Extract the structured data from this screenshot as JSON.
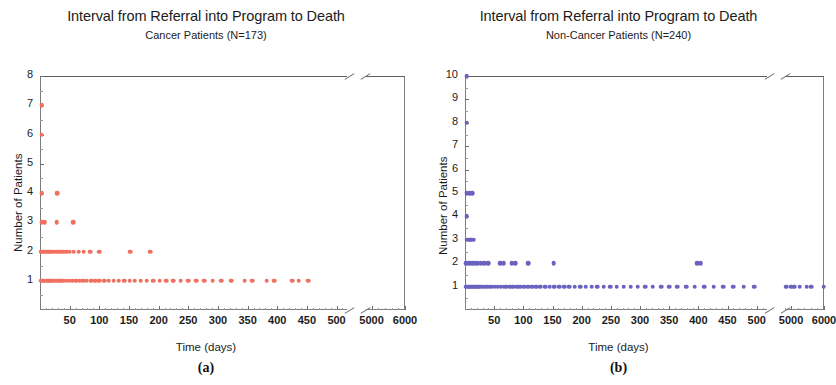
{
  "figure": {
    "caption_a": "(a)",
    "caption_b": "(b)"
  },
  "panels": [
    {
      "key": "a",
      "title": "Interval from Referral into Program to Death",
      "subtitle": "Cancer Patients (N=173)",
      "caption": "(a)",
      "xlabel": "Time (days)",
      "ylabel": "Number of Patients",
      "color": "#F0705F"
    },
    {
      "key": "b",
      "title": "Interval from Referral into Program to Death",
      "subtitle": "Non-Cancer Patients (N=240)",
      "caption": "(b)",
      "xlabel": "Time (days)",
      "ylabel": "Number of Patients",
      "color": "#6A62BE"
    }
  ],
  "chart_data": [
    {
      "type": "scatter",
      "panel": "a",
      "title": "Interval from Referral into Program to Death",
      "subtitle": "Cancer Patients (N=173)",
      "caption": "(a)",
      "xlabel": "Time (days)",
      "ylabel": "Number of Patients",
      "marker_color": "#F0705F",
      "grid": false,
      "legend": "none",
      "axis_break": {
        "from": 520,
        "to": 4800
      },
      "xlim": [
        0,
        6000
      ],
      "ylim": [
        0,
        8
      ],
      "xticks": [
        50,
        100,
        150,
        200,
        250,
        300,
        350,
        400,
        450,
        500,
        5000,
        6000
      ],
      "xticklabels": [
        "50",
        "100",
        "150",
        "200",
        "250",
        "300",
        "350",
        "400",
        "450",
        "500",
        "5000",
        "6000"
      ],
      "yticks": [
        1,
        2,
        3,
        4,
        5,
        6,
        7,
        8
      ],
      "yticklabels": [
        "1",
        "2",
        "3",
        "4",
        "5",
        "6",
        "7",
        "8"
      ],
      "points": [
        {
          "x": 3,
          "y": 7
        },
        {
          "x": 3,
          "y": 6
        },
        {
          "x": 3,
          "y": 4
        },
        {
          "x": 29,
          "y": 4
        },
        {
          "x": 3,
          "y": 3
        },
        {
          "x": 8,
          "y": 3
        },
        {
          "x": 28,
          "y": 3
        },
        {
          "x": 56,
          "y": 3
        },
        {
          "x": 2,
          "y": 2
        },
        {
          "x": 5,
          "y": 2
        },
        {
          "x": 8,
          "y": 2
        },
        {
          "x": 11,
          "y": 2
        },
        {
          "x": 14,
          "y": 2
        },
        {
          "x": 17,
          "y": 2
        },
        {
          "x": 21,
          "y": 2
        },
        {
          "x": 25,
          "y": 2
        },
        {
          "x": 29,
          "y": 2
        },
        {
          "x": 34,
          "y": 2
        },
        {
          "x": 39,
          "y": 2
        },
        {
          "x": 44,
          "y": 2
        },
        {
          "x": 50,
          "y": 2
        },
        {
          "x": 57,
          "y": 2
        },
        {
          "x": 65,
          "y": 2
        },
        {
          "x": 74,
          "y": 2
        },
        {
          "x": 85,
          "y": 2
        },
        {
          "x": 100,
          "y": 2
        },
        {
          "x": 152,
          "y": 2
        },
        {
          "x": 186,
          "y": 2
        },
        {
          "x": 2,
          "y": 1
        },
        {
          "x": 5,
          "y": 1
        },
        {
          "x": 8,
          "y": 1
        },
        {
          "x": 11,
          "y": 1
        },
        {
          "x": 14,
          "y": 1
        },
        {
          "x": 17,
          "y": 1
        },
        {
          "x": 20,
          "y": 1
        },
        {
          "x": 24,
          "y": 1
        },
        {
          "x": 28,
          "y": 1
        },
        {
          "x": 32,
          "y": 1
        },
        {
          "x": 36,
          "y": 1
        },
        {
          "x": 40,
          "y": 1
        },
        {
          "x": 45,
          "y": 1
        },
        {
          "x": 50,
          "y": 1
        },
        {
          "x": 55,
          "y": 1
        },
        {
          "x": 61,
          "y": 1
        },
        {
          "x": 67,
          "y": 1
        },
        {
          "x": 73,
          "y": 1
        },
        {
          "x": 79,
          "y": 1
        },
        {
          "x": 86,
          "y": 1
        },
        {
          "x": 93,
          "y": 1
        },
        {
          "x": 100,
          "y": 1
        },
        {
          "x": 108,
          "y": 1
        },
        {
          "x": 116,
          "y": 1
        },
        {
          "x": 124,
          "y": 1
        },
        {
          "x": 133,
          "y": 1
        },
        {
          "x": 142,
          "y": 1
        },
        {
          "x": 151,
          "y": 1
        },
        {
          "x": 160,
          "y": 1
        },
        {
          "x": 170,
          "y": 1
        },
        {
          "x": 180,
          "y": 1
        },
        {
          "x": 191,
          "y": 1
        },
        {
          "x": 202,
          "y": 1
        },
        {
          "x": 213,
          "y": 1
        },
        {
          "x": 225,
          "y": 1
        },
        {
          "x": 237,
          "y": 1
        },
        {
          "x": 250,
          "y": 1
        },
        {
          "x": 263,
          "y": 1
        },
        {
          "x": 277,
          "y": 1
        },
        {
          "x": 291,
          "y": 1
        },
        {
          "x": 306,
          "y": 1
        },
        {
          "x": 322,
          "y": 1
        },
        {
          "x": 345,
          "y": 1
        },
        {
          "x": 358,
          "y": 1
        },
        {
          "x": 382,
          "y": 1
        },
        {
          "x": 395,
          "y": 1
        },
        {
          "x": 425,
          "y": 1
        },
        {
          "x": 436,
          "y": 1
        },
        {
          "x": 452,
          "y": 1
        }
      ]
    },
    {
      "type": "scatter",
      "panel": "b",
      "title": "Interval from Referral into Program to Death",
      "subtitle": "Non-Cancer Patients (N=240)",
      "caption": "(b)",
      "xlabel": "Time (days)",
      "ylabel": "Number of Patients",
      "marker_color": "#6A62BE",
      "grid": false,
      "legend": "none",
      "axis_break": {
        "from": 520,
        "to": 4800
      },
      "xlim": [
        0,
        6000
      ],
      "ylim": [
        0,
        10
      ],
      "xticks": [
        50,
        100,
        150,
        200,
        250,
        300,
        350,
        400,
        450,
        500,
        5000,
        6000
      ],
      "xticklabels": [
        "50",
        "100",
        "150",
        "200",
        "250",
        "300",
        "350",
        "400",
        "450",
        "500",
        "5000",
        "6000"
      ],
      "yticks": [
        1,
        2,
        3,
        4,
        5,
        6,
        7,
        8,
        9,
        10
      ],
      "yticklabels": [
        "1",
        "2",
        "3",
        "4",
        "5",
        "6",
        "7",
        "8",
        "9",
        "10"
      ],
      "points": [
        {
          "x": 3,
          "y": 10
        },
        {
          "x": 3,
          "y": 8
        },
        {
          "x": 3,
          "y": 5
        },
        {
          "x": 8,
          "y": 5
        },
        {
          "x": 12,
          "y": 5
        },
        {
          "x": 3,
          "y": 4
        },
        {
          "x": 3,
          "y": 3
        },
        {
          "x": 7,
          "y": 3
        },
        {
          "x": 11,
          "y": 3
        },
        {
          "x": 15,
          "y": 3
        },
        {
          "x": 2,
          "y": 2
        },
        {
          "x": 7,
          "y": 2
        },
        {
          "x": 12,
          "y": 2
        },
        {
          "x": 17,
          "y": 2
        },
        {
          "x": 22,
          "y": 2
        },
        {
          "x": 27,
          "y": 2
        },
        {
          "x": 33,
          "y": 2
        },
        {
          "x": 40,
          "y": 2
        },
        {
          "x": 60,
          "y": 2
        },
        {
          "x": 66,
          "y": 2
        },
        {
          "x": 80,
          "y": 2
        },
        {
          "x": 86,
          "y": 2
        },
        {
          "x": 108,
          "y": 2
        },
        {
          "x": 152,
          "y": 2
        },
        {
          "x": 398,
          "y": 2
        },
        {
          "x": 404,
          "y": 2
        },
        {
          "x": 2,
          "y": 1
        },
        {
          "x": 5,
          "y": 1
        },
        {
          "x": 8,
          "y": 1
        },
        {
          "x": 11,
          "y": 1
        },
        {
          "x": 14,
          "y": 1
        },
        {
          "x": 17,
          "y": 1
        },
        {
          "x": 20,
          "y": 1
        },
        {
          "x": 23,
          "y": 1
        },
        {
          "x": 26,
          "y": 1
        },
        {
          "x": 30,
          "y": 1
        },
        {
          "x": 34,
          "y": 1
        },
        {
          "x": 38,
          "y": 1
        },
        {
          "x": 42,
          "y": 1
        },
        {
          "x": 46,
          "y": 1
        },
        {
          "x": 51,
          "y": 1
        },
        {
          "x": 56,
          "y": 1
        },
        {
          "x": 61,
          "y": 1
        },
        {
          "x": 66,
          "y": 1
        },
        {
          "x": 71,
          "y": 1
        },
        {
          "x": 77,
          "y": 1
        },
        {
          "x": 83,
          "y": 1
        },
        {
          "x": 89,
          "y": 1
        },
        {
          "x": 95,
          "y": 1
        },
        {
          "x": 101,
          "y": 1
        },
        {
          "x": 108,
          "y": 1
        },
        {
          "x": 115,
          "y": 1
        },
        {
          "x": 122,
          "y": 1
        },
        {
          "x": 129,
          "y": 1
        },
        {
          "x": 137,
          "y": 1
        },
        {
          "x": 145,
          "y": 1
        },
        {
          "x": 153,
          "y": 1
        },
        {
          "x": 161,
          "y": 1
        },
        {
          "x": 170,
          "y": 1
        },
        {
          "x": 179,
          "y": 1
        },
        {
          "x": 188,
          "y": 1
        },
        {
          "x": 197,
          "y": 1
        },
        {
          "x": 207,
          "y": 1
        },
        {
          "x": 217,
          "y": 1
        },
        {
          "x": 227,
          "y": 1
        },
        {
          "x": 238,
          "y": 1
        },
        {
          "x": 249,
          "y": 1
        },
        {
          "x": 260,
          "y": 1
        },
        {
          "x": 272,
          "y": 1
        },
        {
          "x": 284,
          "y": 1
        },
        {
          "x": 296,
          "y": 1
        },
        {
          "x": 309,
          "y": 1
        },
        {
          "x": 322,
          "y": 1
        },
        {
          "x": 336,
          "y": 1
        },
        {
          "x": 350,
          "y": 1
        },
        {
          "x": 364,
          "y": 1
        },
        {
          "x": 379,
          "y": 1
        },
        {
          "x": 394,
          "y": 1
        },
        {
          "x": 410,
          "y": 1
        },
        {
          "x": 426,
          "y": 1
        },
        {
          "x": 443,
          "y": 1
        },
        {
          "x": 460,
          "y": 1
        },
        {
          "x": 478,
          "y": 1
        },
        {
          "x": 496,
          "y": 1
        },
        {
          "x": 4850,
          "y": 1
        },
        {
          "x": 5000,
          "y": 1
        },
        {
          "x": 5100,
          "y": 1
        },
        {
          "x": 5260,
          "y": 1
        },
        {
          "x": 5480,
          "y": 1
        },
        {
          "x": 5620,
          "y": 1
        },
        {
          "x": 5990,
          "y": 1
        }
      ]
    }
  ]
}
